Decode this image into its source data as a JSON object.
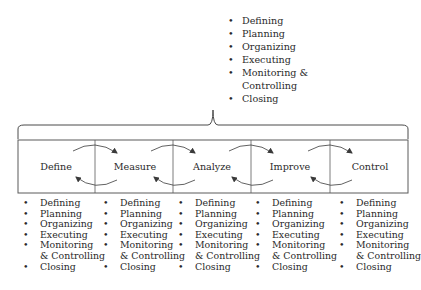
{
  "top_activities": {
    "items": [
      {
        "bullet": "•",
        "text": "Defining"
      },
      {
        "bullet": "•",
        "text": "Planning"
      },
      {
        "bullet": "•",
        "text": "Organizing"
      },
      {
        "bullet": "•",
        "text": "Executing"
      },
      {
        "bullet": "•",
        "text": "Monitoring &"
      },
      {
        "bullet": "",
        "text": "Controlling"
      },
      {
        "bullet": "•",
        "text": "Closing"
      }
    ]
  },
  "stages": [
    {
      "label": "Define"
    },
    {
      "label": "Measure"
    },
    {
      "label": "Analyze"
    },
    {
      "label": "Improve"
    },
    {
      "label": "Control"
    }
  ],
  "stage_activities": [
    {
      "items": [
        {
          "bullet": "•",
          "text": "Defining"
        },
        {
          "bullet": "•",
          "text": "Planning"
        },
        {
          "bullet": "•",
          "text": "Organizing"
        },
        {
          "bullet": "•",
          "text": "Executing"
        },
        {
          "bullet": "•",
          "text": "Monitoring"
        },
        {
          "bullet": "",
          "text": "& Controlling"
        },
        {
          "bullet": "•",
          "text": "Closing"
        }
      ]
    },
    {
      "items": [
        {
          "bullet": "•",
          "text": "Defining"
        },
        {
          "bullet": "•",
          "text": "Planning"
        },
        {
          "bullet": "•",
          "text": "Organizing"
        },
        {
          "bullet": "•",
          "text": "Executing"
        },
        {
          "bullet": "•",
          "text": "Monitoring"
        },
        {
          "bullet": "",
          "text": "& Controlling"
        },
        {
          "bullet": "•",
          "text": "Closing"
        }
      ]
    },
    {
      "items": [
        {
          "bullet": "•",
          "text": "Defining"
        },
        {
          "bullet": "•",
          "text": "Planning"
        },
        {
          "bullet": "•",
          "text": "Organizing"
        },
        {
          "bullet": "•",
          "text": "Executing"
        },
        {
          "bullet": "•",
          "text": "Monitoring"
        },
        {
          "bullet": "",
          "text": "& Controlling"
        },
        {
          "bullet": "•",
          "text": "Closing"
        }
      ]
    },
    {
      "items": [
        {
          "bullet": "•",
          "text": "Defining"
        },
        {
          "bullet": "•",
          "text": "Planning"
        },
        {
          "bullet": "•",
          "text": "Organizing"
        },
        {
          "bullet": "•",
          "text": "Executing"
        },
        {
          "bullet": "•",
          "text": "Monitoring"
        },
        {
          "bullet": "",
          "text": "& Controlling"
        },
        {
          "bullet": "•",
          "text": "Closing"
        }
      ]
    },
    {
      "items": [
        {
          "bullet": "•",
          "text": "Defining"
        },
        {
          "bullet": "•",
          "text": "Planning"
        },
        {
          "bullet": "•",
          "text": "Organizing"
        },
        {
          "bullet": "•",
          "text": "Executing"
        },
        {
          "bullet": "•",
          "text": "Monitoring"
        },
        {
          "bullet": "",
          "text": "& Controlling"
        },
        {
          "bullet": "•",
          "text": "Closing"
        }
      ]
    }
  ],
  "colors": {
    "line": "#4a4a4a",
    "text": "#2a2a2a"
  }
}
